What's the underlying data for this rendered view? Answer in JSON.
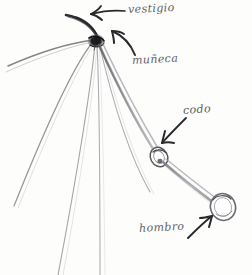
{
  "figure": {
    "medium": "pencil-sketch",
    "background_color": "#fdfdfc",
    "ink_color": "#4a4a4d",
    "pencil_color": "#8d8d92"
  },
  "labels": [
    {
      "id": "vestigio",
      "text": "vestigio",
      "points_to": "claw-vestige",
      "arrow": "arrow-left-straight"
    },
    {
      "id": "muneca",
      "text": "muñeca",
      "points_to": "wrist-knot",
      "arrow": "arrow-curved-up-left"
    },
    {
      "id": "codo",
      "text": "codo",
      "points_to": "elbow-joint",
      "arrow": "arrow-straight-down-left"
    },
    {
      "id": "hombro",
      "text": "hombro",
      "points_to": "shoulder-joint",
      "arrow": "arrow-curved-up-right"
    }
  ],
  "anatomy": {
    "wrist_knot": "wrist-knot",
    "elbow_joint": "elbow-joint",
    "shoulder_joint": "shoulder-joint",
    "finger_bones_count": 5,
    "forearm": "forearm-bone",
    "humerus": "humerus-bone",
    "claw_vestige": "claw-vestige"
  }
}
